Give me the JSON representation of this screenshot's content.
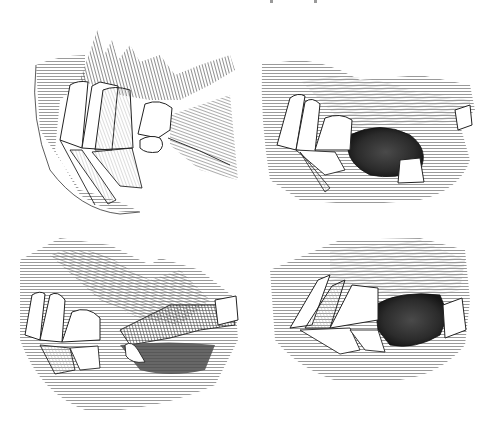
{
  "figure": {
    "style": "black-and-white line engraving with hatching",
    "background_color": "#ffffff",
    "ink_color": "#1a1a1a",
    "shade_color": "#3a3a3a",
    "panels": [
      {
        "id": "top-left",
        "description": "Upper and lower incisors, closed mouth, lip hair above"
      },
      {
        "id": "top-right",
        "description": "Incisors with open mouth cavity and isolated canine tooth"
      },
      {
        "id": "bottom-left",
        "description": "Incisors with extended tongue/lip and protruding lower canine"
      },
      {
        "id": "bottom-right",
        "description": "Worn incisors with dark mouth cavity and rear tooth"
      }
    ]
  }
}
